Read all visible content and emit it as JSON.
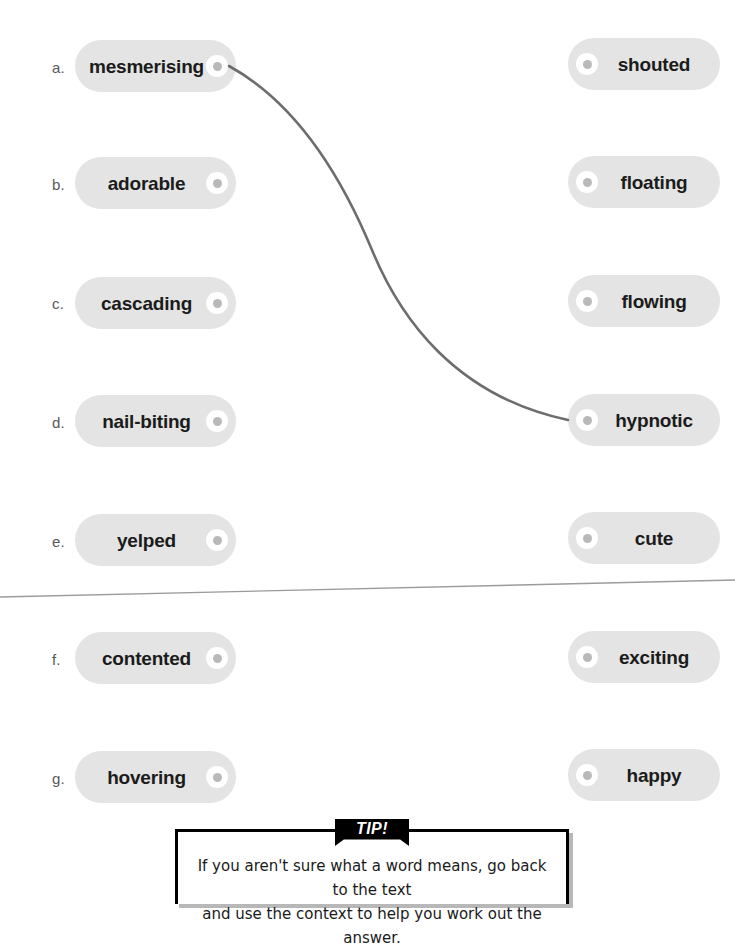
{
  "worksheet": {
    "type": "matching-exercise",
    "left_column": [
      {
        "letter": "a.",
        "word": "mesmerising"
      },
      {
        "letter": "b.",
        "word": "adorable"
      },
      {
        "letter": "c.",
        "word": "cascading"
      },
      {
        "letter": "d.",
        "word": "nail-biting"
      },
      {
        "letter": "e.",
        "word": "yelped"
      },
      {
        "letter": "f.",
        "word": "contented"
      },
      {
        "letter": "g.",
        "word": "hovering"
      }
    ],
    "right_column": [
      {
        "word": "shouted"
      },
      {
        "word": "floating"
      },
      {
        "word": "flowing"
      },
      {
        "word": "hypnotic"
      },
      {
        "word": "cute"
      },
      {
        "word": "exciting"
      },
      {
        "word": "happy"
      }
    ],
    "connections": [
      {
        "from": "mesmerising",
        "to": "hypnotic"
      }
    ]
  },
  "tip": {
    "banner_label": "TIP!",
    "line1": "If you aren't sure what a word means, go back to the text",
    "line2": "and use the context to help you work out the answer."
  },
  "colors": {
    "pill_fill": "#e4e4e4",
    "pill_text": "#1b1b1b",
    "letter_text": "#58595b",
    "node_ring": "#ffffff",
    "node_core": "#b9b9b9",
    "curve_stroke": "#6d6d6d",
    "divider": "#9b9b9e",
    "tip_border": "#000000",
    "tip_banner_bg": "#000000",
    "tip_banner_text": "#ffffff"
  }
}
